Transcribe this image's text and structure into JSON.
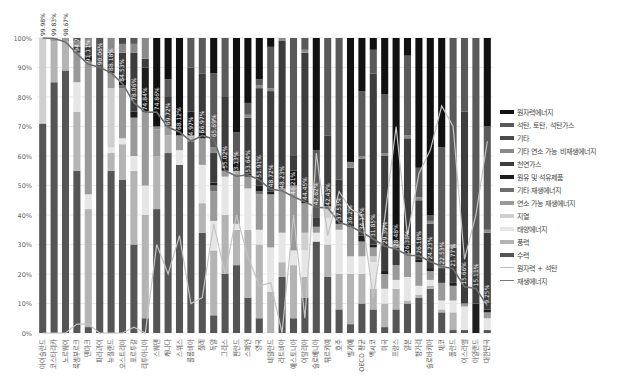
{
  "chart_data": {
    "type": "bar",
    "stacked": true,
    "title": "",
    "xlabel": "",
    "ylabel": "",
    "ylim": [
      0,
      100
    ],
    "y_ticks": [
      "0%",
      "10%",
      "20%",
      "30%",
      "40%",
      "50%",
      "60%",
      "70%",
      "80%",
      "90%",
      "100%"
    ],
    "grid": true,
    "legend_position": "right",
    "categories": [
      "아이슬란드",
      "코스타리카",
      "노르웨이",
      "룩셈부르크",
      "덴마크",
      "파라과이",
      "뉴질랜드",
      "오스트리아",
      "포르투갈",
      "리투아니아",
      "스웨덴",
      "캐나다",
      "스위스",
      "콜롬비아",
      "칠레",
      "독일",
      "그리스",
      "핀란드",
      "스페인",
      "영국",
      "네덜란드",
      "라트비아",
      "에스토니아",
      "이탈리아",
      "슬로베니아",
      "튀르키예",
      "호주",
      "벨기에",
      "OECD 평균",
      "멕시코",
      "미국",
      "프랑스",
      "일본",
      "헝가리",
      "슬로바키아",
      "체코",
      "폴란드",
      "이스라엘",
      "아일랜드",
      "대한민국",
      "멕시코2",
      "칠레2",
      "일본2",
      "헝가리2",
      "체코2",
      "대한민국2"
    ],
    "series": [
      {
        "name": "원자력에너지",
        "color": "#111111"
      },
      {
        "name": "석탄, 토탄, 석탄가스",
        "color": "#5a5a5a"
      },
      {
        "name": "기타",
        "color": "#4a4a4a"
      },
      {
        "name": "기타 연소 가능 비재생에너지",
        "color": "#8a8a8a"
      },
      {
        "name": "천연가스",
        "color": "#3d3d3d"
      },
      {
        "name": "원유 및 석유제품",
        "color": "#1e1e1e"
      },
      {
        "name": "기타 재생에너지",
        "color": "#6e6e6e"
      },
      {
        "name": "연소 가능 재생에너지",
        "color": "#9a9a9a"
      },
      {
        "name": "지열",
        "color": "#cfcfcf"
      },
      {
        "name": "태양에너지",
        "color": "#e6e6e6"
      },
      {
        "name": "풍력",
        "color": "#b4b4b4"
      },
      {
        "name": "수력",
        "color": "#555555"
      },
      {
        "name": "원자력 + 석탄",
        "color": "#b8b8b8",
        "line": true
      },
      {
        "name": "재생에너지",
        "color": "#7a7a7a",
        "line": true
      }
    ],
    "renewable_share_labels": [
      "99.98%",
      "99.83%",
      "98.67%",
      "94.7%",
      "91.11%",
      "90.06%",
      "88.18%",
      "84.53%",
      "78.06%",
      "74.84%",
      "74.86%",
      "69.72%",
      "68.12%",
      "64.97%",
      "66.97%",
      "65.69%",
      "55.02%",
      "53.13%",
      "53.64%",
      "51.91%",
      "48.72%",
      "48.23%",
      "46.21%",
      "44.45%",
      "42.62%",
      "42.43%",
      "37.53%",
      "36.2%",
      "34.15%",
      "31.85%",
      "29.39%",
      "28.48%",
      "26.38%",
      "26.18%",
      "24.23%",
      "22.53%",
      "21.77%",
      "15.66%",
      "15.11%",
      "9.25%"
    ],
    "renewable_share_values": [
      99.98,
      99.83,
      98.67,
      94.7,
      91.11,
      90.06,
      88.18,
      84.53,
      78.06,
      74.84,
      74.86,
      69.72,
      68.12,
      64.97,
      66.97,
      65.69,
      55.02,
      53.13,
      53.64,
      51.91,
      48.72,
      48.23,
      46.21,
      44.45,
      42.62,
      42.43,
      37.53,
      36.2,
      34.15,
      31.85,
      29.39,
      28.48,
      26.38,
      26.18,
      24.23,
      22.53,
      21.77,
      15.66,
      15.11,
      9.25
    ],
    "bars": [
      [
        0,
        0,
        0,
        0,
        0,
        0,
        0,
        0,
        29,
        0,
        0,
        71
      ],
      [
        0,
        0,
        0,
        0,
        0,
        0,
        0,
        1,
        0,
        0,
        14,
        85
      ],
      [
        0,
        0,
        0,
        0,
        0,
        0,
        0,
        1,
        0,
        0,
        10,
        89
      ],
      [
        0,
        0,
        1,
        2,
        2,
        0,
        0,
        10,
        0,
        10,
        20,
        55
      ],
      [
        0,
        0,
        0,
        3,
        3,
        2,
        0,
        45,
        0,
        5,
        40,
        2
      ],
      [
        0,
        0,
        0,
        0,
        0,
        0,
        0,
        0,
        0,
        0,
        0,
        100
      ],
      [
        0,
        0,
        0,
        5,
        7,
        0,
        0,
        5,
        20,
        2,
        6,
        55
      ],
      [
        0,
        0,
        2,
        3,
        9,
        2,
        1,
        17,
        0,
        2,
        12,
        52
      ],
      [
        0,
        2,
        0,
        3,
        20,
        2,
        0,
        13,
        0,
        5,
        25,
        30
      ],
      [
        0,
        0,
        0,
        7,
        3,
        15,
        0,
        25,
        0,
        10,
        35,
        5
      ],
      [
        30,
        0,
        0,
        1,
        0,
        0,
        0,
        9,
        0,
        0,
        18,
        42
      ],
      [
        14,
        6,
        0,
        0,
        10,
        0,
        0,
        3,
        0,
        0,
        6,
        61
      ],
      [
        33,
        0,
        0,
        0,
        0,
        0,
        0,
        5,
        0,
        5,
        0,
        57
      ],
      [
        0,
        10,
        0,
        0,
        15,
        8,
        0,
        2,
        0,
        0,
        0,
        65
      ],
      [
        0,
        12,
        0,
        0,
        20,
        2,
        0,
        9,
        0,
        13,
        10,
        34
      ],
      [
        12,
        25,
        0,
        2,
        10,
        1,
        2,
        10,
        0,
        10,
        22,
        6
      ],
      [
        0,
        20,
        0,
        0,
        20,
        5,
        0,
        2,
        0,
        13,
        20,
        20
      ],
      [
        32,
        8,
        0,
        0,
        2,
        3,
        0,
        18,
        0,
        2,
        12,
        23
      ],
      [
        22,
        4,
        0,
        1,
        19,
        1,
        0,
        4,
        0,
        14,
        23,
        12
      ],
      [
        14,
        2,
        0,
        1,
        33,
        2,
        1,
        12,
        0,
        5,
        25,
        5
      ],
      [
        3,
        14,
        0,
        1,
        34,
        1,
        0,
        18,
        0,
        15,
        14,
        0
      ],
      [
        0,
        0,
        0,
        1,
        50,
        0,
        0,
        15,
        0,
        10,
        5,
        19
      ],
      [
        0,
        40,
        0,
        0,
        5,
        5,
        0,
        22,
        0,
        5,
        18,
        5
      ],
      [
        0,
        4,
        0,
        1,
        50,
        1,
        0,
        10,
        6,
        9,
        7,
        12
      ],
      [
        38,
        23,
        0,
        0,
        3,
        0,
        0,
        2,
        0,
        3,
        0,
        31
      ],
      [
        0,
        33,
        0,
        0,
        23,
        1,
        0,
        1,
        3,
        9,
        11,
        19
      ],
      [
        0,
        48,
        0,
        0,
        14,
        1,
        0,
        2,
        0,
        15,
        12,
        8
      ],
      [
        42,
        0,
        0,
        2,
        20,
        0,
        0,
        10,
        0,
        6,
        17,
        3
      ],
      [
        18,
        22,
        0,
        1,
        26,
        2,
        0,
        5,
        0,
        6,
        10,
        10
      ],
      [
        4,
        8,
        0,
        0,
        58,
        1,
        0,
        3,
        2,
        9,
        7,
        8
      ],
      [
        19,
        20,
        0,
        1,
        39,
        1,
        0,
        5,
        0,
        5,
        8,
        2
      ],
      [
        69,
        1,
        0,
        1,
        6,
        0,
        0,
        5,
        0,
        3,
        7,
        8
      ],
      [
        6,
        27,
        0,
        1,
        36,
        3,
        0,
        8,
        0,
        8,
        1,
        10
      ],
      [
        44,
        10,
        0,
        1,
        20,
        1,
        0,
        8,
        0,
        3,
        1,
        12
      ],
      [
        60,
        2,
        0,
        1,
        15,
        1,
        0,
        3,
        0,
        2,
        1,
        15
      ],
      [
        37,
        40,
        0,
        1,
        5,
        0,
        0,
        6,
        0,
        3,
        1,
        7
      ],
      [
        0,
        70,
        0,
        1,
        12,
        1,
        0,
        5,
        0,
        4,
        6,
        1
      ],
      [
        0,
        25,
        0,
        0,
        65,
        0,
        0,
        1,
        0,
        8,
        0,
        1
      ],
      [
        0,
        40,
        0,
        0,
        5,
        5,
        0,
        0,
        0,
        0,
        0,
        0
      ],
      [
        30,
        35,
        0,
        1,
        26,
        1,
        0,
        2,
        0,
        4,
        0,
        1
      ]
    ]
  },
  "legend": {
    "items": [
      {
        "label": "원자력에너지",
        "color": "#111111",
        "kind": "bar"
      },
      {
        "label": "석탄, 토탄, 석탄가스",
        "color": "#5a5a5a",
        "kind": "bar"
      },
      {
        "label": "기타",
        "color": "#4a4a4a",
        "kind": "bar"
      },
      {
        "label": "기타 연소 가능 비재생에너지",
        "color": "#8a8a8a",
        "kind": "bar"
      },
      {
        "label": "천연가스",
        "color": "#3d3d3d",
        "kind": "bar"
      },
      {
        "label": "원유 및 석유제품",
        "color": "#1e1e1e",
        "kind": "bar"
      },
      {
        "label": "기타 재생에너지",
        "color": "#6e6e6e",
        "kind": "bar"
      },
      {
        "label": "연소 가능 재생에너지",
        "color": "#9a9a9a",
        "kind": "bar"
      },
      {
        "label": "지열",
        "color": "#cfcfcf",
        "kind": "bar"
      },
      {
        "label": "태양에너지",
        "color": "#e6e6e6",
        "kind": "bar"
      },
      {
        "label": "풍력",
        "color": "#b4b4b4",
        "kind": "bar"
      },
      {
        "label": "수력",
        "color": "#555555",
        "kind": "bar"
      },
      {
        "label": "원자력 + 석탄",
        "color": "#bdbdbd",
        "kind": "line"
      },
      {
        "label": "재생에너지",
        "color": "#777777",
        "kind": "line"
      }
    ]
  },
  "axis": {
    "x_labels": [
      "아이슬란드",
      "코스타리카",
      "노르웨이",
      "룩셈부르크",
      "덴마크",
      "파라과이",
      "뉴질랜드",
      "오스트리아",
      "포르투갈",
      "리투아니아",
      "스웨덴",
      "캐나다",
      "스위스",
      "콜롬비아",
      "칠레",
      "독일",
      "그리스",
      "핀란드",
      "스페인",
      "영국",
      "네덜란드",
      "라트비아",
      "에스토니아",
      "이탈리아",
      "슬로베니아",
      "튀르키예",
      "호주",
      "벨기에",
      "OECD 평균",
      "멕시코",
      "미국",
      "프랑스",
      "일본",
      "헝가리",
      "슬로바키아",
      "체코",
      "폴란드",
      "이스라엘",
      "아일랜드",
      "대한민국"
    ]
  },
  "lines": {
    "nuclear_plus_coal": [
      0,
      0,
      0,
      3,
      3,
      0,
      0,
      0,
      2,
      0,
      30,
      20,
      33,
      10,
      12,
      37,
      20,
      40,
      26,
      16,
      17,
      0,
      40,
      5,
      61,
      33,
      48,
      42,
      40,
      12,
      39,
      70,
      33,
      54,
      62,
      77,
      70,
      25,
      40,
      65
    ]
  }
}
